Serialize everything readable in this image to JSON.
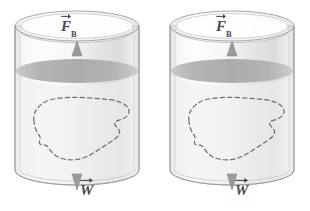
{
  "figure": {
    "background_color": "#ffffff",
    "width": 310,
    "height": 211
  },
  "colors": {
    "outline": "#9a9a9a",
    "glass_light": "#fbfbfb",
    "glass_mid": "#ececec",
    "glass_shadow": "#d9d9d9",
    "water_surface": "#b4b4b4",
    "water_surface_dark": "#a2a2a2",
    "rim_top": "#f4f4f4",
    "arrow": "#8f8f8f",
    "dashed_blob": "#6e6e6e",
    "label_text": "#4a4a4a"
  },
  "panels": [
    {
      "id": "left-cylinder",
      "name": "left container",
      "cylinder": {
        "center_x": 77,
        "top_y": 26,
        "bottom_y": 170,
        "radius_x": 62,
        "radius_y": 15
      },
      "water_surface": {
        "center_x": 77,
        "y": 71,
        "radius_x": 61,
        "radius_y": 12,
        "label": "fluid surface"
      },
      "buoyant_force": {
        "symbol": "F",
        "subscript": "B",
        "vector": true,
        "direction": "up",
        "label_text": "F_B",
        "arrow_tip_y": 44,
        "arrow_tail_y": 118
      },
      "weight_force": {
        "symbol": "W",
        "subscript": "",
        "vector": true,
        "direction": "down",
        "label_text": "W",
        "arrow_tail_y": 118,
        "arrow_tip_y": 188
      },
      "submerged_body": {
        "name": "irregular submerged object",
        "style": "dashed outline",
        "center_x": 78,
        "center_y": 126
      }
    },
    {
      "id": "right-cylinder",
      "name": "right container",
      "cylinder": {
        "center_x": 232,
        "top_y": 26,
        "bottom_y": 170,
        "radius_x": 62,
        "radius_y": 15
      },
      "water_surface": {
        "center_x": 232,
        "y": 71,
        "radius_x": 61,
        "radius_y": 12,
        "label": "fluid surface"
      },
      "buoyant_force": {
        "symbol": "F",
        "subscript": "B",
        "vector": true,
        "direction": "up",
        "label_text": "F_B",
        "arrow_tip_y": 44,
        "arrow_tail_y": 118
      },
      "weight_force": {
        "symbol": "W",
        "subscript": "",
        "vector": true,
        "direction": "down",
        "label_text": "W",
        "arrow_tail_y": 118,
        "arrow_tip_y": 188
      },
      "submerged_body": {
        "name": "irregular submerged object",
        "style": "dashed outline",
        "center_x": 233,
        "center_y": 126
      }
    }
  ]
}
